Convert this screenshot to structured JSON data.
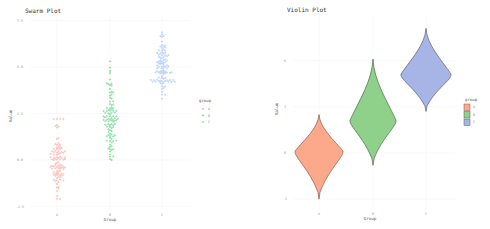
{
  "chart_data": [
    {
      "type": "scatter",
      "subtype": "swarm",
      "title": "Swarm Plot",
      "xlabel": "Group",
      "ylabel": "Value",
      "categories": [
        "A",
        "B",
        "C"
      ],
      "yticks": [
        "7.5",
        "5.0",
        "2.5",
        "0.0",
        "-2.5"
      ],
      "ylim": [
        -2.7,
        7.7
      ],
      "grid": true,
      "legend": {
        "title": "group",
        "position": "right",
        "entries": [
          "A",
          "B",
          "C"
        ]
      },
      "series": [
        {
          "name": "A",
          "color": "#F8766D",
          "center": 0.0,
          "min": -2.3,
          "max": 2.2,
          "n": 100
        },
        {
          "name": "B",
          "color": "#00BA38",
          "center": 2.0,
          "min": 0.0,
          "max": 5.3,
          "n": 100
        },
        {
          "name": "C",
          "color": "#619CFF",
          "center": 5.0,
          "min": 3.3,
          "max": 7.3,
          "n": 100
        }
      ]
    },
    {
      "type": "violin",
      "title": "Violin Plot",
      "xlabel": "Group",
      "ylabel": "Value",
      "categories": [
        "A",
        "B",
        "C"
      ],
      "yticks": [
        "6",
        "3",
        "0",
        "-3"
      ],
      "ylim": [
        -3.5,
        7.5
      ],
      "grid": true,
      "legend": {
        "title": "group",
        "position": "right",
        "entries": [
          "A",
          "B",
          "C"
        ]
      },
      "series": [
        {
          "name": "A",
          "fill": "#FCA98B",
          "stroke": "#8a5a50",
          "median": 0.0,
          "min": -3.0,
          "max": 2.5
        },
        {
          "name": "B",
          "fill": "#8FD08A",
          "stroke": "#4d6a4a",
          "median": 2.0,
          "min": -0.8,
          "max": 6.1
        },
        {
          "name": "C",
          "fill": "#A6B4E6",
          "stroke": "#5a6078",
          "median": 5.0,
          "min": 2.7,
          "max": 8.1
        }
      ]
    }
  ]
}
